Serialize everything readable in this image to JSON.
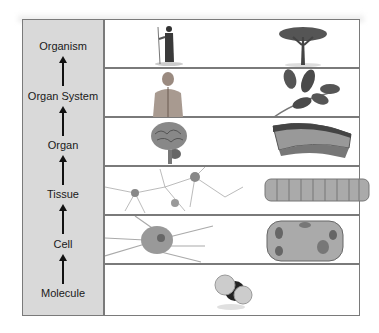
{
  "diagram": {
    "levels": [
      {
        "label": "Organism",
        "images": [
          "human-figure",
          "acacia-tree"
        ]
      },
      {
        "label": "Organ System",
        "images": [
          "human-nervous-system",
          "plant-shoot-leaves"
        ]
      },
      {
        "label": "Organ",
        "images": [
          "brain",
          "leaf-cross-section"
        ]
      },
      {
        "label": "Tissue",
        "images": [
          "nerve-tissue",
          "plant-epidermal-tissue"
        ]
      },
      {
        "label": "Cell",
        "images": [
          "neuron",
          "plant-cell"
        ]
      },
      {
        "label": "Molecule",
        "images": [
          "water-molecule"
        ]
      }
    ],
    "colors": {
      "left_panel": "#d9d9d9",
      "border": "#7a7a7a",
      "text": "#1a1a1a",
      "arrow": "#111111"
    }
  }
}
